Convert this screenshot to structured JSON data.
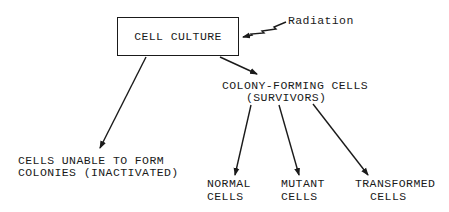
{
  "diagram": {
    "root": {
      "label": "CELL CULTURE"
    },
    "input": {
      "label": "Radiation",
      "icon": "zigzag-arrow"
    },
    "nodes": {
      "inactivated": {
        "line1": "CELLS UNABLE TO FORM",
        "line2": "COLONIES (INACTIVATED)"
      },
      "survivors": {
        "line1": "COLONY-FORMING CELLS",
        "line2": "(SURVIVORS)"
      },
      "normal": {
        "line1": "NORMAL",
        "line2": "CELLS"
      },
      "mutant": {
        "line1": "MUTANT",
        "line2": "CELLS"
      },
      "transformed": {
        "line1": "TRANSFORMED",
        "line2": "CELLS"
      }
    },
    "edges": [
      {
        "from": "Radiation",
        "to": "CELL CULTURE"
      },
      {
        "from": "CELL CULTURE",
        "to": "CELLS UNABLE TO FORM COLONIES (INACTIVATED)"
      },
      {
        "from": "CELL CULTURE",
        "to": "COLONY-FORMING CELLS (SURVIVORS)"
      },
      {
        "from": "COLONY-FORMING CELLS (SURVIVORS)",
        "to": "NORMAL CELLS"
      },
      {
        "from": "COLONY-FORMING CELLS (SURVIVORS)",
        "to": "MUTANT CELLS"
      },
      {
        "from": "COLONY-FORMING CELLS (SURVIVORS)",
        "to": "TRANSFORMED CELLS"
      }
    ],
    "colors": {
      "ink": "#1a1a1a",
      "background": "#ffffff"
    }
  }
}
